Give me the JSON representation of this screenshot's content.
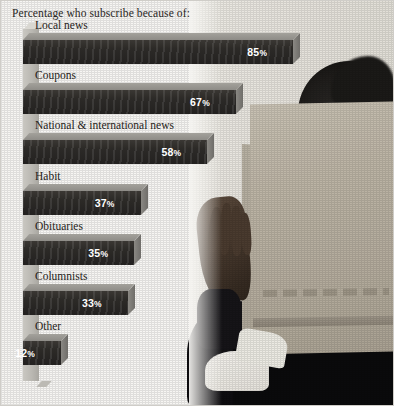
{
  "chart_title": "Percentage who subscribe because of:",
  "colors": {
    "background": "#f7f6f3",
    "bar_front": "#2c2a27",
    "bar_top": "#8e8c87",
    "bar_side": "#6f6d69",
    "axis_wall": "#bab8b2",
    "label_text": "#262320",
    "value_text": "#ffffff"
  },
  "percent_symbol": "%",
  "chart_data": {
    "type": "bar",
    "orientation": "horizontal",
    "title": "Percentage who subscribe because of:",
    "xlabel": "",
    "ylabel": "",
    "xlim": [
      0,
      100
    ],
    "grid": false,
    "legend": null,
    "categories": [
      "Local news",
      "Coupons",
      "National & international news",
      "Habit",
      "Obituaries",
      "Columnists",
      "Other"
    ],
    "values": [
      85,
      67,
      58,
      37,
      35,
      33,
      12
    ],
    "value_labels": [
      "85%",
      "67%",
      "58%",
      "37%",
      "35%",
      "33%",
      "12%"
    ]
  },
  "bars": [
    {
      "label": "Local news",
      "value": 85,
      "value_label": "85",
      "pct": "%"
    },
    {
      "label": "Coupons",
      "value": 67,
      "value_label": "67",
      "pct": "%"
    },
    {
      "label": "National & international news",
      "value": 58,
      "value_label": "58",
      "pct": "%"
    },
    {
      "label": "Habit",
      "value": 37,
      "value_label": "37",
      "pct": "%"
    },
    {
      "label": "Obituaries",
      "value": 35,
      "value_label": "35",
      "pct": "%"
    },
    {
      "label": "Columnists",
      "value": 33,
      "value_label": "33",
      "pct": "%"
    },
    {
      "label": "Other",
      "value": 12,
      "value_label": "12",
      "pct": "%"
    }
  ],
  "photo": {
    "description": "person holding open newspaper"
  }
}
